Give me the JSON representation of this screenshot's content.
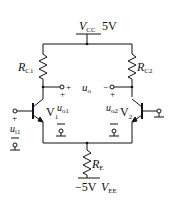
{
  "diagram": {
    "supply_top": {
      "name_main": "V",
      "name_sub": "CC",
      "value": "5V"
    },
    "supply_bottom": {
      "value": "−5V",
      "name_main": "V",
      "name_sub": "EE"
    },
    "resistors": [
      {
        "id": "RC1",
        "main": "R",
        "sub": "C1"
      },
      {
        "id": "RC2",
        "main": "R",
        "sub": "C2"
      },
      {
        "id": "RE",
        "main": "R",
        "sub": "E"
      }
    ],
    "transistors": [
      {
        "id": "V1",
        "main": "V",
        "sub": "1"
      },
      {
        "id": "V2",
        "main": "V",
        "sub": "2"
      }
    ],
    "output": {
      "main": "u",
      "sub": "o",
      "plus": "+",
      "minus": "−"
    },
    "labels": {
      "uo1": {
        "main": "u",
        "sub": "o1",
        "plus": "+",
        "minus": "−"
      },
      "uo2": {
        "main": "u",
        "sub": "o2",
        "plus": "+",
        "minus": "−"
      },
      "ui1": {
        "main": "u",
        "sub": "i1",
        "plus": "+",
        "minus": "−"
      }
    },
    "colors": {
      "line": "#111111",
      "background": "#ffffff"
    }
  }
}
